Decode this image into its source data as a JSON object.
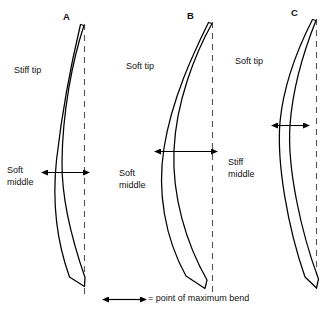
{
  "figure": {
    "type": "diagram",
    "background_color": "#ffffff",
    "line_color": "#000000",
    "width": 326,
    "height": 312
  },
  "bows": [
    {
      "id": "A",
      "label": "A",
      "tip_label": "Stiff tip",
      "middle_label_line1": "Soft",
      "middle_label_line2": "middle",
      "bend_arrow_position": "low",
      "bend_arrow_width_px": 37,
      "bend_arrow_y_px": 172,
      "label_x_px": 63,
      "label_y_px": 11,
      "tip_label_x_px": 14,
      "tip_label_y_px": 65,
      "middle_label_x_px": 7,
      "middle_label_y_px": 165
    },
    {
      "id": "B",
      "label": "B",
      "tip_label": "Soft tip",
      "middle_label_line1": "Soft",
      "middle_label_line2": "middle",
      "bend_arrow_position": "middle",
      "bend_arrow_width_px": 52,
      "bend_arrow_y_px": 151,
      "label_x_px": 187,
      "label_y_px": 10,
      "tip_label_x_px": 126,
      "tip_label_y_px": 61,
      "middle_label_x_px": 119,
      "middle_label_y_px": 168
    },
    {
      "id": "C",
      "label": "C",
      "tip_label": "Soft tip",
      "middle_label_line1": "Stiff",
      "middle_label_line2": "middle",
      "bend_arrow_position": "high",
      "bend_arrow_width_px": 26,
      "bend_arrow_y_px": 125,
      "label_x_px": 291,
      "label_y_px": 7,
      "tip_label_x_px": 235,
      "tip_label_y_px": 56,
      "middle_label_x_px": 228,
      "middle_label_y_px": 157
    }
  ],
  "legend": {
    "symbol_name": "double-headed-arrow",
    "text": "= point of maximum bend",
    "arrow_x_start_px": 108,
    "arrow_x_end_px": 141,
    "arrow_y_px": 299,
    "text_x_px": 148,
    "text_y_px": 294
  }
}
